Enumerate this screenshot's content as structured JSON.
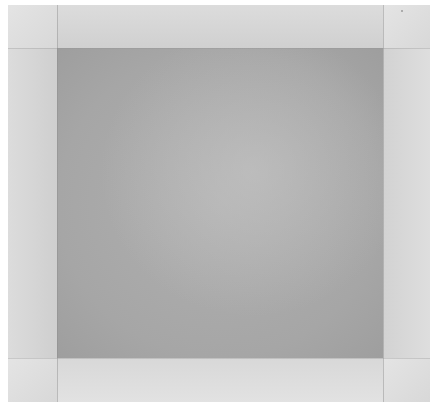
{
  "image": {
    "description": "Grayscale abstract composition: dark gray central square framed by lighter gray borders divided into nine panels",
    "colors": {
      "background": "#ffffff",
      "frame": "#d6d6d6",
      "corner": "#e0e0e0",
      "center": "#a8a8a8",
      "divider": "#8c8c8c"
    },
    "regions": {
      "outer": {
        "x": 8,
        "y": 5,
        "w": 422,
        "h": 397
      },
      "center": {
        "x": 57,
        "y": 48,
        "w": 326,
        "h": 310
      }
    }
  }
}
